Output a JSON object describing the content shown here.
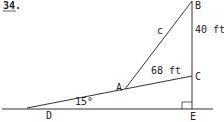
{
  "problem_number": "34.",
  "points": {
    "A": "A",
    "B": "B",
    "C": "C",
    "D": "D",
    "E": "E"
  },
  "labels": {
    "side_c": "c",
    "BC": "40 ft",
    "AC": "68 ft",
    "angle_D": "15°"
  },
  "colors": {
    "line": "#333333",
    "background": "#ffffff"
  }
}
